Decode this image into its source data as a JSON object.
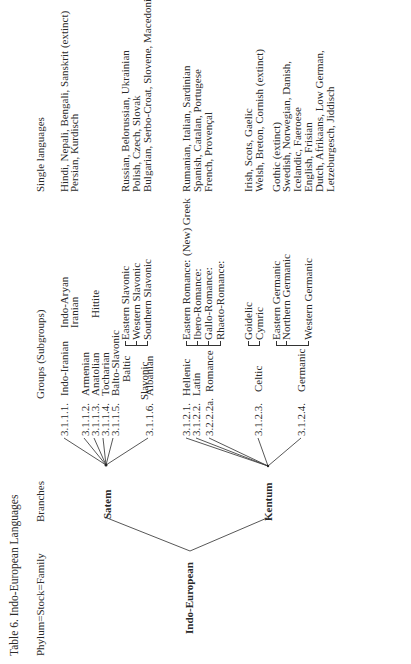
{
  "table": {
    "title": "Table 6. Indo-European Languages",
    "headers": {
      "phylum": "Phylum=Stock=Family",
      "branches": "Branches",
      "groups": "Groups (Subgroups)",
      "single": "Single languages"
    },
    "root": "Indo-European",
    "branches": [
      {
        "name": "Satem",
        "groups": [
          {
            "code": "3.1.1.1.",
            "name": "Indo-Iranian",
            "subgroups": [
              "Indo-Aryan",
              "Iranian"
            ],
            "languages": [
              "Hindi, Nepali, Bengali, Sanskrit (extinct)",
              "Persian, Kurdisch"
            ]
          },
          {
            "code": "3.1.1.2.",
            "name": "Armenian"
          },
          {
            "code": "3.1.1.3.",
            "name": "Anatolian",
            "subgroups": [
              "Hittite"
            ]
          },
          {
            "code": "3.1.1.4.",
            "name": "Tocharian"
          },
          {
            "code": "3.1.1.5.",
            "name": "Balto-Slavonic",
            "children": [
              "Baltic",
              "Slavonic"
            ],
            "subgroups": [
              "Eastern Slavonic",
              "Western Slavonic",
              "Southern Slavonic"
            ],
            "languages": [
              "Russian, Belorussian, Ukrainian",
              "Polish, Czech, Slovak",
              "Bulgarian, Serbo-Croat, Slovene, Macedonian"
            ]
          },
          {
            "code": "3.1.1.6.",
            "name": "Albanian"
          }
        ]
      },
      {
        "name": "Kentum",
        "groups": [
          {
            "code": "3.1.2.1.",
            "name": "Hellenic",
            "languages": [
              "(New) Greek"
            ]
          },
          {
            "code": "3.1.2.2.",
            "name": "Latin"
          },
          {
            "code": "3.2.2.2a.",
            "name": "Romance",
            "subgroups": [
              "Eastern Romance:",
              "Ibero-Romance:",
              "Gallo-Romance:",
              "Rhaeto-Romance:"
            ],
            "languages": [
              "Rumanian, Italian, Sardinian",
              "Spanish, Catalan, Portugese",
              "French, Provençal"
            ]
          },
          {
            "code": "3.1.2.3.",
            "name": "Celtic",
            "subgroups": [
              "Goidelic",
              "Cymric"
            ],
            "languages": [
              "Irish, Scots, Gaelic",
              "Welsh, Breton, Cornish (extinct)"
            ]
          },
          {
            "code": "3.1.2.4.",
            "name": "Germanic",
            "subgroups": [
              "Eastern Germanic",
              "Northern Germanic",
              "Western Germanic"
            ],
            "languages": [
              "Gothic (extinct)",
              "Swedish, Norwegian, Danish,",
              "Icelandic, Faeroese",
              "English, Frisian",
              "Dutch, Afrikaans, Low German,",
              "Letzeburgesch, Jiddisch"
            ]
          }
        ]
      }
    ]
  }
}
